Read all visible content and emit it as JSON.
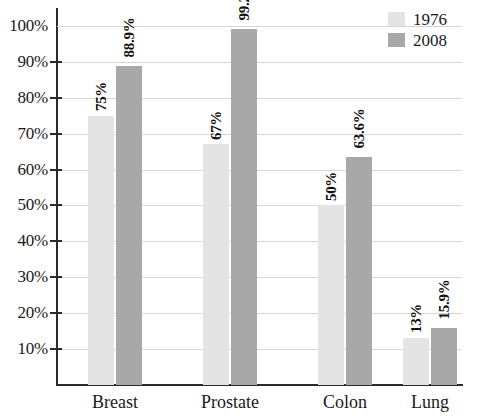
{
  "chart_data": {
    "type": "bar",
    "title": "",
    "subtitle": "",
    "xlabel": "",
    "ylabel": "",
    "categories": [
      "Breast",
      "Prostate",
      "Colon",
      "Lung"
    ],
    "series": [
      {
        "name": "1976",
        "color": "#e4e4e4",
        "values": [
          75,
          67,
          50,
          13
        ],
        "labels": [
          "75%",
          "67%",
          "50%",
          "13%"
        ]
      },
      {
        "name": "2008",
        "color": "#a8a8a8",
        "values": [
          88.9,
          99.2,
          63.6,
          15.9
        ],
        "labels": [
          "88.9%",
          "99.2%",
          "63.6%",
          "15.9%"
        ]
      }
    ],
    "ylim": [
      0,
      105
    ],
    "yticks": [
      10,
      20,
      30,
      40,
      50,
      60,
      70,
      80,
      90,
      100
    ],
    "ytick_labels": [
      "10%",
      "20%",
      "30%",
      "40%",
      "50%",
      "60%",
      "70%",
      "80%",
      "90%",
      "100%"
    ],
    "grid": true,
    "legend_position": "top-right",
    "value_label_rotation": "vertical"
  },
  "legend": {
    "entries": [
      {
        "label": "1976",
        "color": "#e4e4e4"
      },
      {
        "label": "2008",
        "color": "#a8a8a8"
      }
    ]
  }
}
